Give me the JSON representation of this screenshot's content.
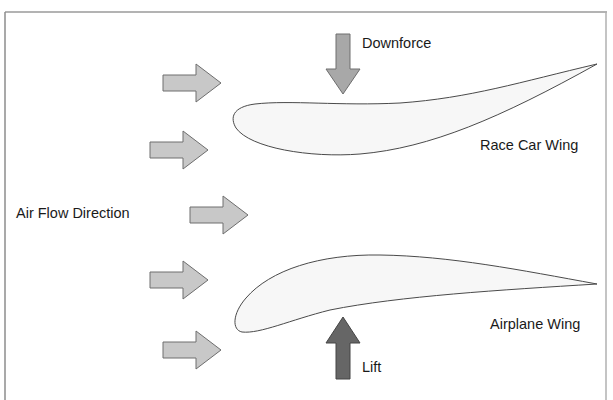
{
  "labels": {
    "downforce": "Downforce",
    "race_car_wing": "Race Car Wing",
    "air_flow_direction": "Air Flow Direction",
    "airplane_wing": "Airplane Wing",
    "lift": "Lift"
  },
  "colors": {
    "frame": "#8c8c8c",
    "flow_arrow_fill": "#c8c8c8",
    "flow_arrow_stroke": "#6e6e6e",
    "downforce_arrow_fill": "#a8a8a8",
    "lift_arrow_fill": "#666666",
    "wing_fill": "#f7f7f7",
    "wing_stroke": "#4a4a4a"
  },
  "flow_arrows_count": 5
}
